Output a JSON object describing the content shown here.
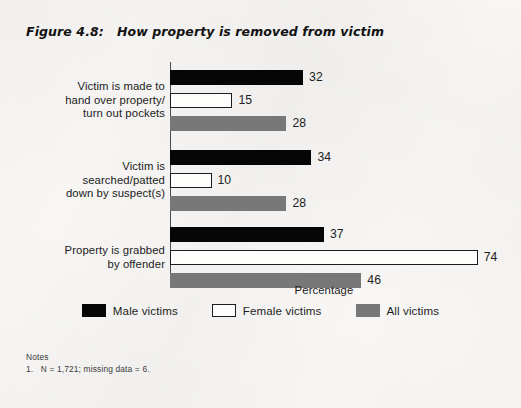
{
  "figure": {
    "number": "Figure 4.8:",
    "title": "How property is removed from victim"
  },
  "notes": {
    "heading": "Notes",
    "items": [
      "1.   N = 1,721; missing data = 6."
    ]
  },
  "chart_data": {
    "type": "bar",
    "orientation": "horizontal",
    "title": "How property is removed from victim",
    "xlabel": "Percentage",
    "ylabel": "",
    "xlim": [
      0,
      80
    ],
    "grid": false,
    "legend_position": "bottom",
    "categories": [
      "Victim is made to\nhand over property/\nturn out pockets",
      "Victim is\nsearched/patted\ndown by suspect(s)",
      "Property is grabbed\nby offender"
    ],
    "series": [
      {
        "name": "Male victims",
        "color": "#060606",
        "values": [
          32,
          34,
          37
        ]
      },
      {
        "name": "Female victims",
        "color": "#ffffff",
        "values": [
          15,
          10,
          74
        ]
      },
      {
        "name": "All victims",
        "color": "#787878",
        "values": [
          28,
          28,
          46
        ]
      }
    ]
  }
}
